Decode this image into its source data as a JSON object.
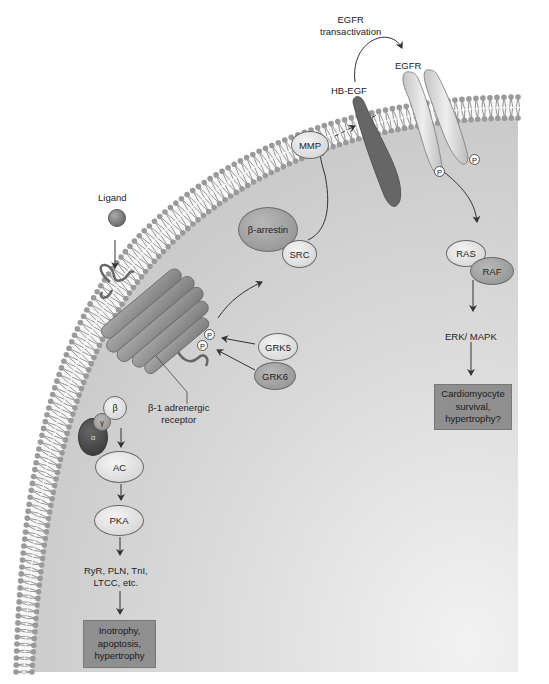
{
  "diagram": {
    "labels": {
      "ligand": "Ligand",
      "egfr_transactivation_line1": "EGFR",
      "egfr_transactivation_line2": "transactivation",
      "egfr": "EGFR",
      "hb_egf": "HB-EGF",
      "mmp": "MMP",
      "beta_arrestin": "β-arrestin",
      "src": "SRC",
      "grk5": "GRK5",
      "grk6": "GRK6",
      "receptor_line1": "β-1 adrenergic",
      "receptor_line2": "receptor",
      "g_beta": "β",
      "g_gamma": "γ",
      "g_alpha": "α",
      "ac": "AC",
      "pka": "PKA",
      "targets_line1": "RyR, PLN, TnI,",
      "targets_line2": "LTCC, etc.",
      "ras": "RAS",
      "raf": "RAF",
      "erk_mapk": "ERK/ MAPK",
      "phospho": "P"
    },
    "outcomes": {
      "left": [
        "Inotrophy,",
        "apoptosis,",
        "hypertrophy"
      ],
      "right": [
        "Cardiomyocyte",
        "survival,",
        "hypertrophy?"
      ]
    },
    "pathways": [
      {
        "name": "G-protein pathway",
        "steps": [
          "Ligand",
          "β-1 adrenergic receptor",
          "G protein (α β γ)",
          "AC",
          "PKA",
          "RyR, PLN, TnI, LTCC, etc.",
          "Inotrophy, apoptosis, hypertrophy"
        ]
      },
      {
        "name": "β-arrestin pathway",
        "steps": [
          "GRK5/GRK6 phosphorylation",
          "β-arrestin / SRC",
          "MMP",
          "HB-EGF",
          "EGFR transactivation",
          "RAS / RAF",
          "ERK/ MAPK",
          "Cardiomyocyte survival, hypertrophy?"
        ]
      }
    ],
    "colors": {
      "background": "#ffffff",
      "cytoplasm": "#d6d6d6",
      "lipid_head": "#9a9a9a",
      "lipid_tail": "#8a8a8a",
      "outcome_box": "#8f8f8f",
      "dark_protein": "#555555",
      "mid_protein": "#8f8f8f",
      "light_protein": "#e6e6e6"
    }
  }
}
